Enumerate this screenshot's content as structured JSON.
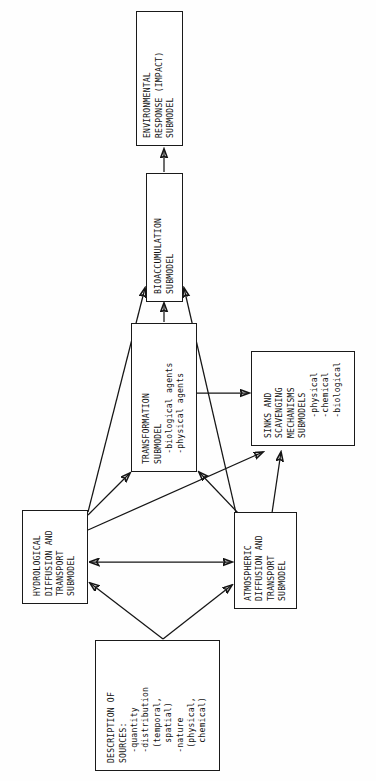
{
  "figure": {
    "orientation": "rotated-90-ccw",
    "background_color": "#fefefe",
    "ink_color": "#151515"
  },
  "nodes": {
    "environmental_response": {
      "label": "ENVIRONMENTAL\nRESPONSE (IMPACT)\nSUBMODEL",
      "name": "environmental-response-submodel-box"
    },
    "bioaccumulation": {
      "label": "BIOACCUMULATION\nSUBMODEL",
      "name": "bioaccumulation-submodel-box"
    },
    "transformation": {
      "label": "TRANSFORMATION\nSUBMODEL\n  -biological agents\n  -physical agents",
      "name": "transformation-submodel-box"
    },
    "sinks": {
      "label": "SINKS AND\nSCAVENGING\nMECHANISMS\nSUBMODELS\n    -physical\n    -chemical\n    -biological",
      "name": "sinks-and-scavenging-mechanisms-submodels-box"
    },
    "hydrological": {
      "label": "HYDROLOGICAL\nDIFFUSION AND\nTRANSPORT\nSUBMODEL",
      "name": "hydrological-diffusion-and-transport-submodel-box"
    },
    "atmospheric": {
      "label": "ATMOSPHERIC\nDIFFUSION AND\nTRANSPORT\nSUBMODEL",
      "name": "atmospheric-diffusion-and-transport-submodel-box"
    },
    "description_of_sources": {
      "label": "DESCRIPTION OF\nSOURCES:\n  -quantity\n  -distribution\n   (temporal,\n    spatial)\n  -nature\n   (physical,\n    chemical)",
      "name": "description-of-sources-box"
    }
  },
  "edges": [
    {
      "from": "bioaccumulation",
      "to": "environmental_response",
      "arrow": "single"
    },
    {
      "from": "transformation",
      "to": "bioaccumulation",
      "arrow": "single"
    },
    {
      "from": "hydrological",
      "to": "bioaccumulation",
      "arrow": "single"
    },
    {
      "from": "atmospheric",
      "to": "bioaccumulation",
      "arrow": "single"
    },
    {
      "from": "hydrological",
      "to": "transformation",
      "arrow": "single"
    },
    {
      "from": "atmospheric",
      "to": "transformation",
      "arrow": "single"
    },
    {
      "from": "transformation",
      "to": "sinks",
      "arrow": "single"
    },
    {
      "from": "hydrological",
      "to": "sinks",
      "arrow": "single"
    },
    {
      "from": "atmospheric",
      "to": "sinks",
      "arrow": "single"
    },
    {
      "from": "hydrological",
      "to": "atmospheric",
      "arrow": "double"
    },
    {
      "from": "description_of_sources",
      "to": "hydrological",
      "arrow": "single"
    },
    {
      "from": "description_of_sources",
      "to": "atmospheric",
      "arrow": "single"
    }
  ]
}
